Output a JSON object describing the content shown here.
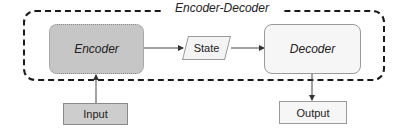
{
  "diagram": {
    "container": {
      "label": "Encoder-Decoder",
      "style": "dashed-rounded"
    },
    "nodes": [
      {
        "id": "encoder",
        "label": "Encoder",
        "shape": "rounded-rect",
        "fill": "#c6c6c6",
        "border": "dotted"
      },
      {
        "id": "state",
        "label": "State",
        "shape": "parallelogram",
        "fill": "#f4f4f4"
      },
      {
        "id": "decoder",
        "label": "Decoder",
        "shape": "rounded-rect",
        "fill": "#f6f6f6"
      },
      {
        "id": "input",
        "label": "Input",
        "shape": "rect",
        "fill": "#cdcdcd"
      },
      {
        "id": "output",
        "label": "Output",
        "shape": "rect",
        "fill": "#f6f6f6"
      }
    ],
    "edges": [
      {
        "from": "input",
        "to": "encoder"
      },
      {
        "from": "encoder",
        "to": "state"
      },
      {
        "from": "state",
        "to": "decoder"
      },
      {
        "from": "decoder",
        "to": "output"
      }
    ]
  }
}
